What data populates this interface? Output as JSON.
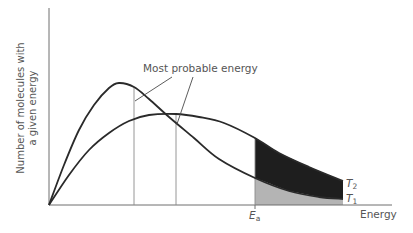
{
  "chart_data": {
    "type": "line",
    "title": "",
    "xlabel": "Energy",
    "ylabel_line1": "Number of molecules with",
    "ylabel_line2": "a given energy",
    "annotation": "Most probable energy",
    "activation_energy_label": {
      "main": "E",
      "sub": "a"
    },
    "grid": false,
    "legend": "inline labels at curve ends",
    "series": [
      {
        "name": "T1",
        "label_main": "T",
        "label_sub": "1",
        "description": "lower temperature – taller, narrower peak",
        "points": [
          [
            0,
            0
          ],
          [
            15,
            40
          ],
          [
            30,
            75
          ],
          [
            45,
            100
          ],
          [
            60,
            117
          ],
          [
            70,
            122
          ],
          [
            85,
            118
          ],
          [
            100,
            106
          ],
          [
            120,
            88
          ],
          [
            145,
            67
          ],
          [
            170,
            46
          ],
          [
            206,
            27
          ],
          [
            240,
            14
          ],
          [
            270,
            8
          ],
          [
            294,
            6
          ]
        ],
        "peak_x": 85
      },
      {
        "name": "T2",
        "label_main": "T",
        "label_sub": "2",
        "description": "higher temperature – lower, broader peak shifted right",
        "points": [
          [
            0,
            0
          ],
          [
            20,
            30
          ],
          [
            40,
            55
          ],
          [
            60,
            72
          ],
          [
            80,
            84
          ],
          [
            100,
            90
          ],
          [
            127,
            91
          ],
          [
            150,
            88
          ],
          [
            175,
            82
          ],
          [
            206,
            67
          ],
          [
            230,
            52
          ],
          [
            260,
            38
          ],
          [
            294,
            24
          ]
        ],
        "peak_x": 127
      }
    ],
    "shading": {
      "from_x": 206,
      "T2_excess_color": "#1e1e1e",
      "T1_area_color": "#b4b4b4"
    },
    "axes_px": {
      "origin_x": 49,
      "origin_y": 205,
      "x_end": 392,
      "y_top": 8
    }
  }
}
